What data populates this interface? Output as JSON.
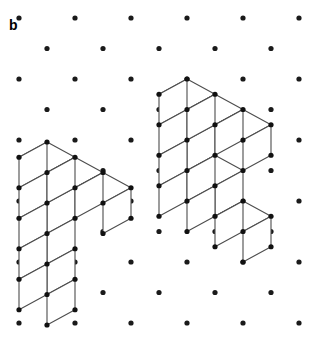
{
  "figure": {
    "panel_label": "b",
    "width": 317,
    "height": 346,
    "background_color": "#ffffff"
  },
  "lattice": {
    "name": "triangular-dot-lattice",
    "dot_color": "#1a1a1a",
    "dot_radius": 2.6,
    "origin_x": 19,
    "origin_y": 18,
    "column_spacing": 56,
    "row_spacing": 30.5,
    "row_offset": 28,
    "columns": 6,
    "rows": 11
  },
  "render": {
    "edge_color": "#4d4d4d",
    "edge_width": 1.1,
    "vertex_color": "#111111",
    "vertex_radius": 2.6,
    "face_fill": "#ffffff"
  },
  "geometry": {
    "unit_u": [
      28,
      15.25
    ],
    "unit_v": [
      -28,
      15.25
    ],
    "unit_w": [
      0,
      30.5
    ],
    "note": "u = right-down axis, v = left-down axis, w = vertical-down axis"
  },
  "structures": [
    {
      "name": "left-polycube",
      "anchor_x": 47,
      "anchor_y": 142,
      "cubes": [
        {
          "u": 0,
          "v": 0,
          "w": 0
        },
        {
          "u": 1,
          "v": 0,
          "w": 0
        },
        {
          "u": 2,
          "v": 0,
          "w": 0
        },
        {
          "u": 0,
          "v": 0,
          "w": 1
        },
        {
          "u": 0,
          "v": 0,
          "w": 2
        },
        {
          "u": 0,
          "v": 0,
          "w": 3
        },
        {
          "u": 0,
          "v": 0,
          "w": 4
        }
      ],
      "cube_count": 7,
      "shape": "L-shaped: 3 cubes across the top, 4 more descending vertically from the left end"
    },
    {
      "name": "right-polycube",
      "anchor_x": 187,
      "anchor_y": 79,
      "cubes": [
        {
          "u": 0,
          "v": 0,
          "w": 0
        },
        {
          "u": 1,
          "v": 0,
          "w": 0
        },
        {
          "u": 2,
          "v": 0,
          "w": 0
        },
        {
          "u": 0,
          "v": 0,
          "w": 1
        },
        {
          "u": 0,
          "v": 0,
          "w": 2
        },
        {
          "u": 1,
          "v": 0,
          "w": 2
        },
        {
          "u": 0,
          "v": 0,
          "w": 3
        },
        {
          "u": 1,
          "v": 0,
          "w": 3
        },
        {
          "u": 2,
          "v": 0,
          "w": 3
        }
      ],
      "cube_count": 9,
      "shape": "Staircase: 3 cubes across the top, a vertical drop, then widening rows of 2 and 3 cubes"
    }
  ]
}
